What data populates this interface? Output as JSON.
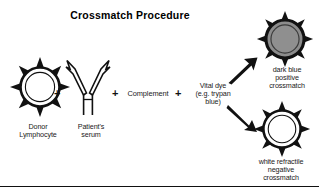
{
  "diagram": {
    "title": "Crossmatch Procedure",
    "title_color": "#000000",
    "background_color": "#ffffff",
    "stroke_color": "#111111",
    "positive_fill_color": "#8c8c8c",
    "negative_fill_color": "#ffffff"
  },
  "reagents": [
    {
      "id": "donor-lymphocyte",
      "label": "Donor\nLymphocyte",
      "icon": "spiked-cell-icon",
      "fill": "#ffffff"
    },
    {
      "id": "patients-serum",
      "label": "Patient's\nserum",
      "icon": "antibody-y-icon"
    },
    {
      "id": "complement",
      "label": "Complement",
      "icon": "text-term"
    },
    {
      "id": "vital-dye",
      "label": "Vital dye\n(e.g. trypan\nblue)",
      "icon": "text-term"
    }
  ],
  "operators": {
    "plus_1": "+",
    "plus_2": "+",
    "plus_3": "+"
  },
  "outcomes": [
    {
      "id": "positive-crossmatch",
      "label": "dark blue\npositive\ncrossmatch",
      "icon": "spiked-cell-filled-icon",
      "fill": "#8c8c8c",
      "arrow": "arrow-up-right-icon"
    },
    {
      "id": "negative-crossmatch",
      "label": "white refractile\nnegative\ncrossmatch",
      "icon": "spiked-cell-icon",
      "fill": "#ffffff",
      "arrow": "arrow-down-right-icon"
    }
  ]
}
